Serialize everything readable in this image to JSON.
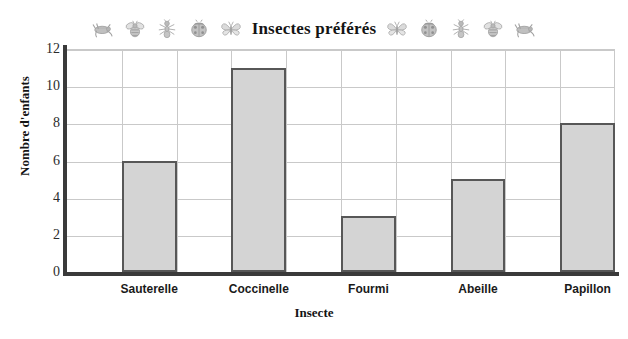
{
  "chart_data": {
    "type": "bar",
    "title": "Insectes préférés",
    "xlabel": "Insecte",
    "ylabel": "Nombre d'enfants",
    "categories": [
      "Sauterelle",
      "Coccinelle",
      "Fourmi",
      "Abeille",
      "Papillon"
    ],
    "values": [
      6,
      11,
      3,
      5,
      8
    ],
    "ylim": [
      0,
      12
    ],
    "yticks": [
      0,
      2,
      4,
      6,
      8,
      10,
      12
    ],
    "ytick_labels": [
      "0",
      "2",
      "4",
      "6",
      "8",
      "10",
      "12"
    ],
    "grid": true,
    "legend": false,
    "bar_fill_color": "#d4d4d4",
    "bar_border_color": "#575757",
    "grid_color": "#c9c9c9",
    "axis_color": "#3a3a3a"
  },
  "decor": {
    "left_icons": [
      "grasshopper-icon",
      "bee-icon",
      "ant-icon",
      "ladybug-icon",
      "butterfly-icon"
    ],
    "right_icons": [
      "butterfly-icon",
      "ladybug-icon",
      "ant-icon",
      "bee-icon",
      "grasshopper-icon"
    ]
  }
}
